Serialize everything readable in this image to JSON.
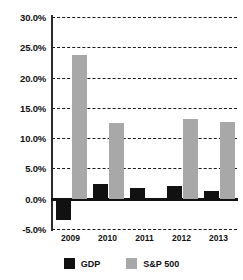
{
  "chart_data": {
    "type": "bar",
    "title": "",
    "subtitle": "",
    "xlabel": "",
    "ylabel": "",
    "categories": [
      "2009",
      "2010",
      "2011",
      "2012",
      "2013"
    ],
    "series": [
      {
        "name": "GDP",
        "color": "#111111",
        "values": [
          -3.5,
          2.4,
          1.7,
          2.1,
          1.3
        ]
      },
      {
        "name": "S&P 500",
        "color": "#a8a8a8",
        "values": [
          23.7,
          12.5,
          0.0,
          13.2,
          12.7
        ]
      }
    ],
    "ylim": [
      -5.0,
      30.0
    ],
    "ytick_values": [
      30.0,
      25.0,
      20.0,
      15.0,
      10.0,
      5.0,
      0.0,
      -5.0
    ],
    "ytick_labels": [
      "30.0%",
      "25.0%",
      "20.0%",
      "15.0%",
      "10.0%",
      "5.0%",
      "0.0%",
      "-5.0%"
    ],
    "grid": true,
    "grid_style": "dashed",
    "legend_position": "bottom",
    "value_format": "percent"
  },
  "legend": {
    "items": [
      {
        "label": "GDP",
        "color": "#111111"
      },
      {
        "label": "S&P 500",
        "color": "#a8a8a8"
      }
    ]
  },
  "colors": {
    "gdp": "#111111",
    "snp500": "#a8a8a8",
    "axis": "#111111",
    "grid": "#1a1a1a",
    "background": "#ffffff"
  }
}
